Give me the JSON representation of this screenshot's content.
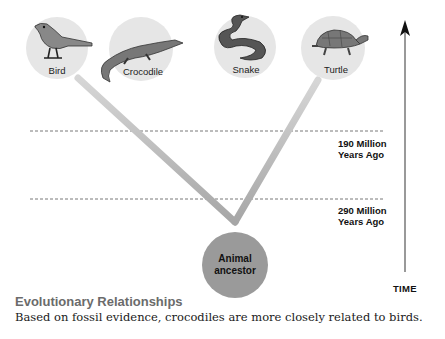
{
  "diagram": {
    "type": "phylogenetic-tree",
    "organisms": [
      {
        "label": "Bird",
        "icon": "bird-icon"
      },
      {
        "label": "Crocodile",
        "icon": "crocodile-icon"
      },
      {
        "label": "Snake",
        "icon": "snake-icon"
      },
      {
        "label": "Turtle",
        "icon": "turtle-icon"
      }
    ],
    "ancestor": {
      "line1": "Animal",
      "line2": "ancestor"
    },
    "eras": [
      {
        "line1": "190 Million",
        "line2": "Years Ago"
      },
      {
        "line1": "290 Million",
        "line2": "Years Ago"
      }
    ],
    "time_axis": {
      "label": "TIME",
      "icon": "arrow-up-icon"
    },
    "colors": {
      "circle_fill": "#e4e4e4",
      "branch": "#b5b5b5",
      "ancestor_fill": "#9a9a9a",
      "dashed_line": "#555555",
      "caption_title": "#6b6b6b"
    }
  },
  "caption": {
    "title": "Evolutionary Relationships",
    "body": "Based on fossil evidence, crocodiles are more closely related to birds."
  }
}
